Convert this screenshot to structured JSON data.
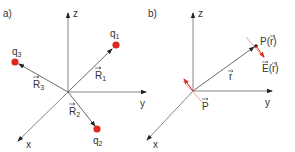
{
  "figure": {
    "panel_a": {
      "label": "a)",
      "axes": {
        "x": "x",
        "y": "y",
        "z": "z"
      },
      "charges": [
        {
          "name": "q",
          "sub": "1"
        },
        {
          "name": "q",
          "sub": "2"
        },
        {
          "name": "q",
          "sub": "3"
        }
      ],
      "vectors": [
        {
          "name": "R",
          "sub": "1"
        },
        {
          "name": "R",
          "sub": "2"
        },
        {
          "name": "R",
          "sub": "3"
        }
      ]
    },
    "panel_b": {
      "label": "b)",
      "axes": {
        "x": "x",
        "y": "y",
        "z": "z"
      },
      "point_label": "P(r)",
      "point_name": "P(",
      "point_arg": "r",
      "point_close": ")",
      "field_name": "E(",
      "field_arg": "r",
      "field_close": ")",
      "position_vector": "r",
      "dipole_moment": "P"
    },
    "colors": {
      "axis": "#555555",
      "charge": "#e0281e",
      "field": "#e0281e",
      "plane": "#e88a80"
    }
  }
}
